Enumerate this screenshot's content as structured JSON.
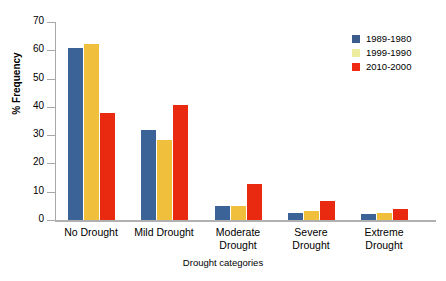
{
  "chart_data": {
    "type": "bar",
    "title": "",
    "xlabel": "Drought categories",
    "ylabel": "% Frequency",
    "categories": [
      "No Drought",
      "Mild Drought",
      "Moderate Drought",
      "Severe Drought",
      "Extreme Drought"
    ],
    "category_lines": [
      [
        "No Drought"
      ],
      [
        "Mild Drought"
      ],
      [
        "Moderate",
        "Drought"
      ],
      [
        "Severe",
        "Drought"
      ],
      [
        "Extreme",
        "Drought"
      ]
    ],
    "series": [
      {
        "name": "1989-1980",
        "color": "#3c6398",
        "legend_color": "#3b5c8c",
        "values": [
          60.8,
          31.8,
          5.0,
          2.5,
          2.1
        ]
      },
      {
        "name": "1999-1990",
        "color": "#f0c03c",
        "legend_color": "#ededa0",
        "values": [
          62.2,
          28.3,
          5.0,
          3.2,
          2.5
        ]
      },
      {
        "name": "2010-2000",
        "color": "#ea2a10",
        "legend_color": "#f02a12",
        "values": [
          37.8,
          40.6,
          12.7,
          6.7,
          3.9
        ]
      }
    ],
    "ylim": [
      0,
      70
    ],
    "yticks": [
      0,
      10,
      20,
      30,
      40,
      50,
      60,
      70
    ],
    "ytick_labels": [
      "0",
      "10",
      "20",
      "30",
      "40",
      "50",
      "60",
      "70"
    ],
    "grid": false,
    "legend_position": "top-right"
  }
}
